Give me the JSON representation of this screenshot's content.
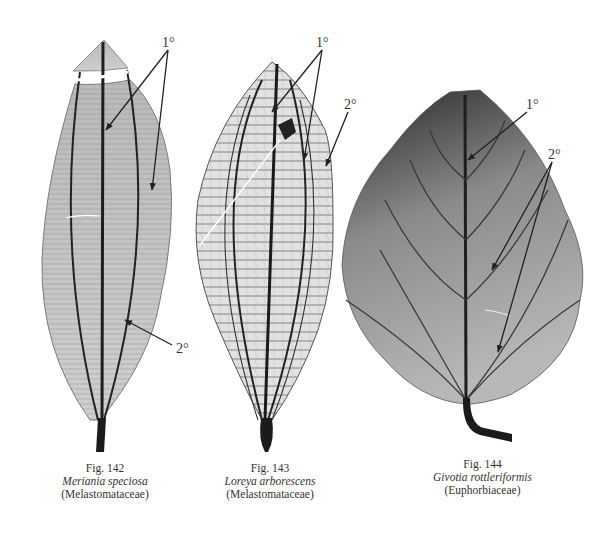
{
  "figures": [
    {
      "number": "Fig. 142",
      "species": "Meriania speciosa",
      "family": "(Melastomataceae)",
      "annotations": [
        {
          "label": "1°",
          "targets": 2
        },
        {
          "label": "2°",
          "targets": 1
        }
      ]
    },
    {
      "number": "Fig. 143",
      "species": "Loreya arborescens",
      "family": "(Melastomataceae)",
      "annotations": [
        {
          "label": "1°",
          "targets": 2
        },
        {
          "label": "2°",
          "targets": 1
        }
      ]
    },
    {
      "number": "Fig. 144",
      "species": "Givotia rottleriformis",
      "family": "(Euphorbiaceae)",
      "annotations": [
        {
          "label": "1°",
          "targets": 1
        },
        {
          "label": "2°",
          "targets": 2
        }
      ]
    }
  ],
  "colors": {
    "background": "#ffffff",
    "leaf_light": "#c8c8c8",
    "leaf_mid": "#9a9a9a",
    "leaf_dark": "#2b2b2b",
    "vein": "#1e1e1e",
    "arrow": "#222222"
  }
}
